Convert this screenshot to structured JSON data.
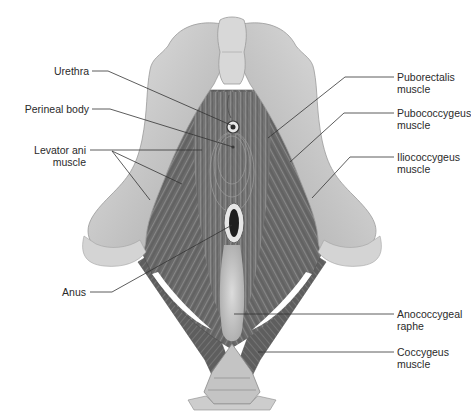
{
  "diagram": {
    "colors": {
      "background": "#ffffff",
      "bone_light": "#d9d9d9",
      "bone_mid": "#bdbdbd",
      "bone_dark": "#9a9a9a",
      "muscle_light": "#8c8c8c",
      "muscle_mid": "#6e6e6e",
      "muscle_dark": "#4f4f4f",
      "raphe": "#cfcfcf",
      "text": "#2a2a2a",
      "leader_line": "#333333"
    },
    "labels_left": [
      {
        "id": "urethra",
        "line1": "Urethra",
        "line2": ""
      },
      {
        "id": "perineal-body",
        "line1": "Perineal body",
        "line2": ""
      },
      {
        "id": "levator-ani",
        "line1": "Levator ani",
        "line2": "muscle"
      },
      {
        "id": "anus",
        "line1": "Anus",
        "line2": ""
      }
    ],
    "labels_right": [
      {
        "id": "puborectalis",
        "line1": "Puborectalis",
        "line2": "muscle"
      },
      {
        "id": "pubococcygeus",
        "line1": "Pubococcygeus",
        "line2": "muscle"
      },
      {
        "id": "iliococcygeus",
        "line1": "Iliococcygeus",
        "line2": "muscle"
      },
      {
        "id": "anococcygeal-raphe",
        "line1": "Anococcygeal",
        "line2": "raphe"
      },
      {
        "id": "coccygeus",
        "line1": "Coccygeus",
        "line2": "muscle"
      }
    ]
  }
}
